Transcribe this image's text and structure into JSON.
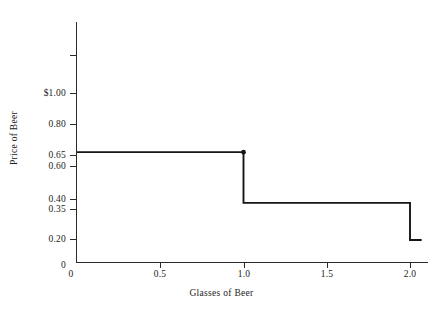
{
  "chart_data": {
    "type": "line",
    "subtype": "step-function",
    "title": "",
    "xlabel": "Glasses of Beer",
    "ylabel": "Price of Beer",
    "xlim": [
      0,
      2.07
    ],
    "ylim": [
      0,
      1.22
    ],
    "grid": false,
    "legend": null,
    "x_ticks": [
      {
        "value": 0,
        "label": "0"
      },
      {
        "value": 0.5,
        "label": "0.5"
      },
      {
        "value": 1.0,
        "label": "1.0"
      },
      {
        "value": 1.5,
        "label": "1.5"
      },
      {
        "value": 2.0,
        "label": "2.0"
      }
    ],
    "y_ticks": [
      {
        "value": 1.0,
        "label": "$1.00"
      },
      {
        "value": 0.8,
        "label": "0.80"
      },
      {
        "value": 0.65,
        "label": "0.65"
      },
      {
        "value": 0.6,
        "label": "0.60"
      },
      {
        "value": 0.4,
        "label": "0.40"
      },
      {
        "value": 0.35,
        "label": "0.35"
      },
      {
        "value": 0.2,
        "label": "0.20"
      },
      {
        "value": 0,
        "label": "0"
      }
    ],
    "steps": [
      {
        "x_start": 0.0,
        "x_end": 1.0,
        "y": 0.65
      },
      {
        "x_start": 1.0,
        "x_end": 2.0,
        "y": 0.35
      },
      {
        "x_start": 2.0,
        "x_end": 2.07,
        "y": 0.13
      }
    ],
    "markers": [
      {
        "x": 1.0,
        "y": 0.65
      }
    ],
    "series": [
      {
        "name": "Price of Beer",
        "x": [
          0.0,
          1.0,
          1.0,
          2.0,
          2.0,
          2.07
        ],
        "values": [
          0.65,
          0.65,
          0.35,
          0.35,
          0.13,
          0.13
        ]
      }
    ],
    "colors": {
      "line": "#161616",
      "axis": "#2b2b2b",
      "text": "#222222",
      "background": "#ffffff"
    }
  }
}
